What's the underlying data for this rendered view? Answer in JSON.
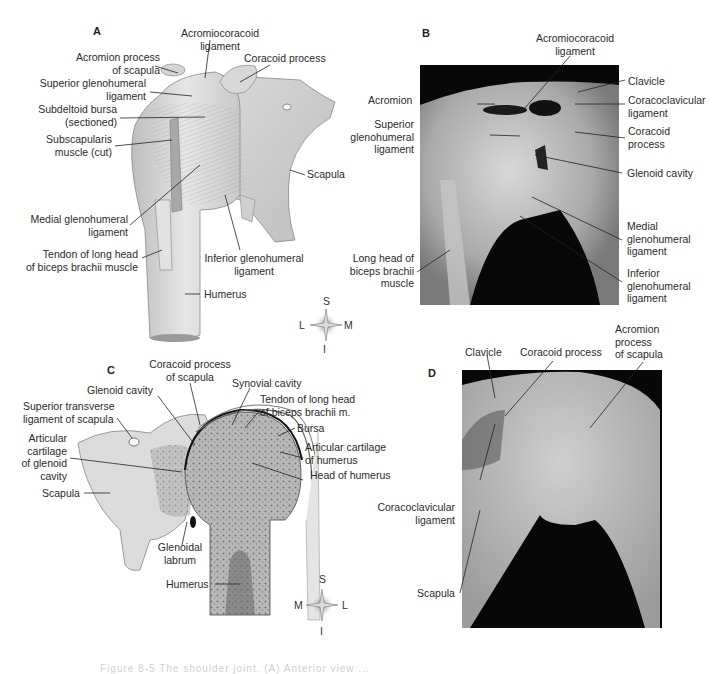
{
  "figure": {
    "caption_partial": "Figure 8-5  The shoulder joint. (A) Anterior view ..."
  },
  "panels": {
    "A": {
      "letter": "A",
      "labels": {
        "acromiocoracoid_1": "Acromiocoracoid",
        "acromiocoracoid_2": "ligament",
        "acromion_1": "Acromion process",
        "acromion_2": "of scapula",
        "coracoid": "Coracoid process",
        "sup_gleno_1": "Superior glenohumeral",
        "sup_gleno_2": "ligament",
        "subdeltoid_1": "Subdeltoid bursa",
        "subdeltoid_2": "(sectioned)",
        "subscap_1": "Subscapularis",
        "subscap_2": "muscle (cut)",
        "scapula": "Scapula",
        "med_gleno_1": "Medial glenohumeral",
        "med_gleno_2": "ligament",
        "tendon_1": "Tendon of long head",
        "tendon_2": "of biceps brachii muscle",
        "inf_gleno_1": "Inferior glenohumeral",
        "inf_gleno_2": "ligament",
        "humerus": "Humerus"
      },
      "compass": {
        "top": "S",
        "bottom": "I",
        "left": "L",
        "right": "M"
      }
    },
    "B": {
      "letter": "B",
      "labels": {
        "acromiocoracoid_1": "Acromiocoracoid",
        "acromiocoracoid_2": "ligament",
        "clavicle": "Clavicle",
        "acromion": "Acromion",
        "coracoclav_1": "Coracoclavicular",
        "coracoclav_2": "ligament",
        "sup_gleno_1": "Superior",
        "sup_gleno_2": "glenohumeral",
        "sup_gleno_3": "ligament",
        "coracoid_1": "Coracoid",
        "coracoid_2": "process",
        "glenoid": "Glenoid cavity",
        "med_gleno_1": "Medial",
        "med_gleno_2": "glenohumeral",
        "med_gleno_3": "ligament",
        "longhead_1": "Long head of",
        "longhead_2": "biceps brachii",
        "longhead_3": "muscle",
        "inf_gleno_1": "Inferior",
        "inf_gleno_2": "glenohumeral",
        "inf_gleno_3": "ligament"
      }
    },
    "C": {
      "letter": "C",
      "labels": {
        "coracoid_1": "Coracoid process",
        "coracoid_2": "of scapula",
        "glenoid": "Glenoid cavity",
        "synovial": "Synovial cavity",
        "tendon_1": "Tendon of long head",
        "tendon_2": "of biceps brachii m.",
        "sup_trans_1": "Superior transverse",
        "sup_trans_2": "ligament of scapula",
        "bursa": "Bursa",
        "artic_glen_1": "Articular",
        "artic_glen_2": "cartilage",
        "artic_glen_3": "of glenoid",
        "artic_glen_4": "cavity",
        "artic_hum_1": "Articular cartilage",
        "artic_hum_2": "of humerus",
        "head_humerus": "Head of humerus",
        "scapula": "Scapula",
        "labrum_1": "Glenoidal",
        "labrum_2": "labrum",
        "humerus": "Humerus"
      },
      "compass": {
        "top": "S",
        "bottom": "I",
        "left": "M",
        "right": "L"
      }
    },
    "D": {
      "letter": "D",
      "labels": {
        "clavicle": "Clavicle",
        "coracoid": "Coracoid process",
        "acromion_1": "Acromion",
        "acromion_2": "process",
        "acromion_3": "of scapula",
        "coracoclav_1": "Coracoclavicular",
        "coracoclav_2": "ligament",
        "scapula": "Scapula"
      }
    }
  }
}
